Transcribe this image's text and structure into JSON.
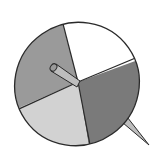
{
  "figure": {
    "sections": [
      {
        "name": "top-right",
        "fill": "#ffffff"
      },
      {
        "name": "bottom-right",
        "fill": "#7a7a7a"
      },
      {
        "name": "bottom-left",
        "fill": "#d2d2d2"
      },
      {
        "name": "top-left",
        "fill": "#9a9a9a"
      }
    ],
    "outline_color": "#2a2a2a",
    "stick_fill": "#bdbdbd"
  }
}
